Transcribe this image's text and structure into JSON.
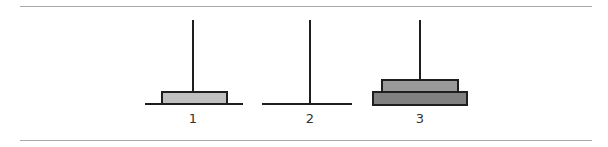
{
  "diagram": {
    "pegs": [
      {
        "label": "1",
        "center_x": 193,
        "base": {
          "x1": 145,
          "x2": 243
        },
        "disks": [
          {
            "size": "small",
            "x1": 161,
            "x2": 228,
            "y_top": 91,
            "y_bottom": 105,
            "color": "#c0c0c0"
          }
        ]
      },
      {
        "label": "2",
        "center_x": 310,
        "base": {
          "x1": 262,
          "x2": 352
        },
        "disks": []
      },
      {
        "label": "3",
        "center_x": 420,
        "base": {
          "x1": 372,
          "x2": 468
        },
        "disks": [
          {
            "size": "medium",
            "x1": 381,
            "x2": 459,
            "y_top": 79,
            "y_bottom": 92,
            "color": "#9a9a9a"
          },
          {
            "size": "large",
            "x1": 372,
            "x2": 468,
            "y_top": 91,
            "y_bottom": 105,
            "color": "#808080"
          }
        ]
      }
    ]
  }
}
